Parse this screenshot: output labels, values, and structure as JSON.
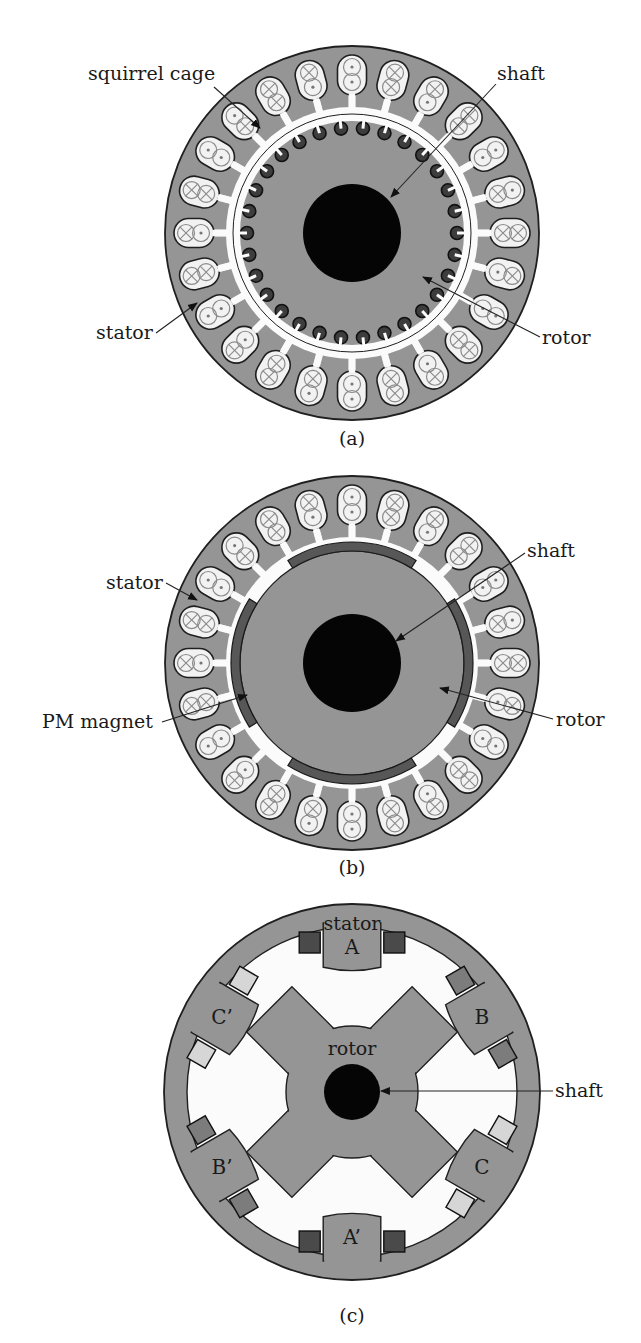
{
  "colors": {
    "iron": "#959595",
    "outline": "#1f1f1f",
    "slot_fill": "#f2f2f2",
    "air_gap": "#fbfbfb",
    "shaft": "#050505",
    "rotor_bar": "#3d3d3d",
    "pm_magnet": "#575757",
    "coil_dark": "#4a4a4a",
    "coil_mid": "#7c7c7c",
    "coil_light": "#d6d6d6",
    "conductor_symbol": "#8a8a8a",
    "background": "#ffffff"
  },
  "figures": [
    {
      "id": "a",
      "caption": "(a)",
      "type": "induction-motor",
      "center": [
        352,
        233
      ],
      "stator_outer_r": 187,
      "stator_slots": 24,
      "rotor_r": 112,
      "rotor_bars": 30,
      "shaft_r": 49,
      "slot_conductors": [
        "dot-dot",
        "cross-cross",
        "dot-cross",
        "cross-cross",
        "dot-dot",
        "cross-dot",
        "cross-cross",
        "dot-cross",
        "dot-dot",
        "cross-cross",
        "dot-cross",
        "cross-cross",
        "dot-dot",
        "cross-dot",
        "cross-cross",
        "dot-cross",
        "dot-dot",
        "cross-cross",
        "dot-cross",
        "cross-cross",
        "dot-dot",
        "cross-dot",
        "cross-cross",
        "dot-cross"
      ],
      "labels": [
        {
          "text": "squirrel cage",
          "x": 88,
          "y": 80,
          "anchor": "start",
          "arrow_from": [
            214,
            87
          ],
          "arrow_to": [
            260,
            128
          ]
        },
        {
          "text": "shaft",
          "x": 497,
          "y": 80,
          "anchor": "start",
          "arrow_from": [
            496,
            84
          ],
          "arrow_to": [
            391,
            197
          ]
        },
        {
          "text": "stator",
          "x": 96,
          "y": 339,
          "anchor": "start",
          "arrow_from": [
            156,
            333
          ],
          "arrow_to": [
            197,
            303
          ]
        },
        {
          "text": "rotor",
          "x": 542,
          "y": 344,
          "anchor": "start",
          "arrow_from": [
            540,
            337
          ],
          "arrow_to": [
            423,
            277
          ]
        }
      ],
      "caption_y": 445
    },
    {
      "id": "b",
      "caption": "(b)",
      "type": "pm-motor",
      "center": [
        352,
        663
      ],
      "stator_outer_r": 187,
      "stator_slots": 24,
      "rotor_r": 112,
      "magnet_inner_r": 112,
      "magnet_outer_r": 121,
      "magnets": 4,
      "magnet_span_deg": 64,
      "shaft_r": 49,
      "slot_conductors": [
        "dot-dot",
        "cross-cross",
        "dot-cross",
        "cross-cross",
        "dot-dot",
        "cross-dot",
        "cross-cross",
        "dot-cross",
        "dot-dot",
        "cross-cross",
        "dot-cross",
        "cross-cross",
        "dot-dot",
        "cross-dot",
        "cross-cross",
        "dot-cross",
        "dot-dot",
        "cross-cross",
        "dot-cross",
        "cross-cross",
        "dot-dot",
        "cross-dot",
        "cross-cross",
        "dot-cross"
      ],
      "labels": [
        {
          "text": "stator",
          "x": 106,
          "y": 589,
          "anchor": "start",
          "arrow_from": [
            166,
            583
          ],
          "arrow_to": [
            197,
            600
          ]
        },
        {
          "text": "shaft",
          "x": 527,
          "y": 557,
          "anchor": "start",
          "arrow_from": [
            525,
            553
          ],
          "arrow_to": [
            396,
            641
          ]
        },
        {
          "text": "PM magnet",
          "x": 42,
          "y": 728,
          "anchor": "start",
          "arrow_from": [
            162,
            722
          ],
          "arrow_to": [
            247,
            695
          ]
        },
        {
          "text": "rotor",
          "x": 556,
          "y": 726,
          "anchor": "start",
          "arrow_from": [
            553,
            719
          ],
          "arrow_to": [
            440,
            688
          ]
        }
      ],
      "caption_y": 874
    },
    {
      "id": "c",
      "caption": "(c)",
      "type": "switched-reluctance-motor",
      "center": [
        352,
        1092
      ],
      "stator_outer_r": 188,
      "stator_inner_r": 165,
      "stator_pole_r": 128,
      "stator_poles": 6,
      "rotor_poles": 4,
      "rotor_pole_r": 117,
      "rotor_core_r": 66,
      "shaft_r": 28,
      "pole_labels": [
        {
          "text": "A",
          "angle_deg": 90
        },
        {
          "text": "B",
          "angle_deg": 30
        },
        {
          "text": "C",
          "angle_deg": -30
        },
        {
          "text": "A’",
          "angle_deg": -90
        },
        {
          "text": "B’",
          "angle_deg": -150
        },
        {
          "text": "C’",
          "angle_deg": 150
        }
      ],
      "coil_shades": {
        "A": "coil_dark",
        "B": "coil_mid",
        "C": "coil_light"
      },
      "labels": [
        {
          "text": "stator",
          "x": 352,
          "y": 930,
          "anchor": "middle"
        },
        {
          "text": "rotor",
          "x": 352,
          "y": 1055,
          "anchor": "middle"
        },
        {
          "text": "shaft",
          "x": 555,
          "y": 1097,
          "anchor": "start",
          "arrow_from": [
            553,
            1091
          ],
          "arrow_to": [
            381,
            1091
          ]
        }
      ],
      "caption_y": 1322
    }
  ]
}
